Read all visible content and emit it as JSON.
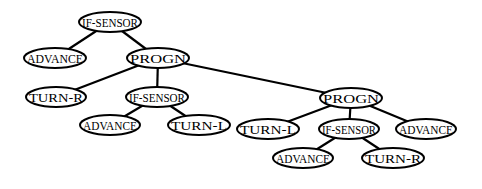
{
  "diagram": {
    "type": "tree",
    "nodes": [
      {
        "id": "n0",
        "label": "IF-SENSOR",
        "cx": 110,
        "cy": 22,
        "rx": 31,
        "ry": 10
      },
      {
        "id": "n1",
        "label": "ADVANCE",
        "cx": 55,
        "cy": 58,
        "rx": 31,
        "ry": 10
      },
      {
        "id": "n2",
        "label": "PROGN",
        "cx": 158,
        "cy": 58,
        "rx": 31,
        "ry": 10
      },
      {
        "id": "n3",
        "label": "TURN-R",
        "cx": 56,
        "cy": 97,
        "rx": 30,
        "ry": 10
      },
      {
        "id": "n4",
        "label": "IF-SENSOR",
        "cx": 157,
        "cy": 97,
        "rx": 31,
        "ry": 10
      },
      {
        "id": "n5",
        "label": "PROGN",
        "cx": 351,
        "cy": 98,
        "rx": 31,
        "ry": 10
      },
      {
        "id": "n6",
        "label": "ADVANCE",
        "cx": 110,
        "cy": 125,
        "rx": 30,
        "ry": 10
      },
      {
        "id": "n7",
        "label": "TURN-L",
        "cx": 199,
        "cy": 125,
        "rx": 31,
        "ry": 10
      },
      {
        "id": "n8",
        "label": "TURN-L",
        "cx": 268,
        "cy": 129,
        "rx": 31,
        "ry": 10
      },
      {
        "id": "n9",
        "label": "IF-SENSOR",
        "cx": 349,
        "cy": 129,
        "rx": 30,
        "ry": 10
      },
      {
        "id": "n10",
        "label": "ADVANCE",
        "cx": 426,
        "cy": 129,
        "rx": 30,
        "ry": 10
      },
      {
        "id": "n11",
        "label": "ADVANCE",
        "cx": 303,
        "cy": 158,
        "rx": 30,
        "ry": 10
      },
      {
        "id": "n12",
        "label": "TURN-R",
        "cx": 393,
        "cy": 158,
        "rx": 31,
        "ry": 10
      }
    ],
    "edges": [
      {
        "from": "n0",
        "to": "n1"
      },
      {
        "from": "n0",
        "to": "n2"
      },
      {
        "from": "n2",
        "to": "n3"
      },
      {
        "from": "n2",
        "to": "n4"
      },
      {
        "from": "n2",
        "to": "n5"
      },
      {
        "from": "n4",
        "to": "n6"
      },
      {
        "from": "n4",
        "to": "n7"
      },
      {
        "from": "n5",
        "to": "n8"
      },
      {
        "from": "n5",
        "to": "n9"
      },
      {
        "from": "n5",
        "to": "n10"
      },
      {
        "from": "n9",
        "to": "n11"
      },
      {
        "from": "n9",
        "to": "n12"
      }
    ]
  }
}
